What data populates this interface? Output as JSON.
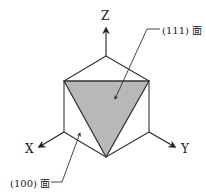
{
  "diagram": {
    "axes": {
      "z": "Z",
      "x": "X",
      "y": "Y"
    },
    "labels": {
      "face_111": "(111) 面",
      "face_100": "(100) 面"
    },
    "colors": {
      "line": "#333333",
      "face_fill": "#b8b8b8",
      "background": "#ffffff"
    }
  }
}
